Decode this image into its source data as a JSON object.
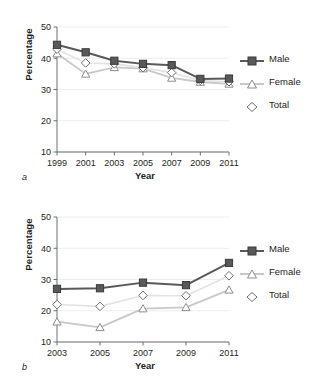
{
  "figure": {
    "panels": [
      {
        "key": "a",
        "label": "a",
        "axis": {
          "xlabel": "Year",
          "ylabel": "Percentage",
          "xticks": [
            "1999",
            "2001",
            "2003",
            "2005",
            "2007",
            "2009",
            "2011"
          ],
          "yticks": [
            "50",
            "40",
            "30",
            "20",
            "10"
          ]
        },
        "legend": [
          {
            "name": "Male",
            "marker": "square",
            "color": "#58595b"
          },
          {
            "name": "Female",
            "marker": "triangle",
            "color": "#c7c8ca"
          },
          {
            "name": "Total",
            "marker": "diamond",
            "color": "#c7c8ca"
          }
        ]
      },
      {
        "key": "b",
        "label": "b",
        "axis": {
          "xlabel": "Year",
          "ylabel": "Percentage",
          "xticks": [
            "2003",
            "2005",
            "2007",
            "2009",
            "2011"
          ],
          "yticks": [
            "50",
            "40",
            "30",
            "20",
            "10"
          ]
        },
        "legend": [
          {
            "name": "Male",
            "marker": "square",
            "color": "#58595b"
          },
          {
            "name": "Female",
            "marker": "triangle",
            "color": "#c7c8ca"
          },
          {
            "name": "Total",
            "marker": "diamond",
            "color": "#c7c8ca"
          }
        ]
      }
    ]
  },
  "chart_data": [
    {
      "type": "line",
      "panel": "a",
      "title": "",
      "xlabel": "Year",
      "ylabel": "Percentage",
      "categories": [
        1999,
        2001,
        2003,
        2005,
        2007,
        2009,
        2011
      ],
      "xlim": [
        1999,
        2011
      ],
      "ylim": [
        10,
        50
      ],
      "yticks": [
        10,
        20,
        30,
        40,
        50
      ],
      "grid": "horizontal",
      "legend_position": "right",
      "series": [
        {
          "name": "Male",
          "marker": "square",
          "color": "#58595b",
          "values": [
            44.3,
            41.9,
            39.2,
            38.2,
            37.8,
            33.4,
            33.5
          ]
        },
        {
          "name": "Female",
          "marker": "triangle",
          "color": "#c7c8ca",
          "values": [
            41.5,
            35.0,
            37.1,
            36.7,
            33.7,
            32.4,
            31.8
          ]
        },
        {
          "name": "Total",
          "marker": "diamond",
          "color": "#c7c8ca",
          "values": [
            42.9,
            38.5,
            38.2,
            37.0,
            35.4,
            32.9,
            32.5
          ]
        }
      ]
    },
    {
      "type": "line",
      "panel": "b",
      "title": "",
      "xlabel": "Year",
      "ylabel": "Percentage",
      "categories": [
        2003,
        2005,
        2007,
        2009,
        2011
      ],
      "xlim": [
        2003,
        2011
      ],
      "ylim": [
        10,
        50
      ],
      "yticks": [
        10,
        20,
        30,
        40,
        50
      ],
      "grid": "horizontal",
      "legend_position": "right",
      "series": [
        {
          "name": "Male",
          "marker": "square",
          "color": "#58595b",
          "values": [
            27.0,
            27.2,
            29.0,
            28.2,
            35.3
          ]
        },
        {
          "name": "Female",
          "marker": "triangle",
          "color": "#c7c8ca",
          "values": [
            16.5,
            14.7,
            20.7,
            21.1,
            26.7
          ]
        },
        {
          "name": "Total",
          "marker": "diamond",
          "color": "#c7c8ca",
          "values": [
            22.0,
            21.4,
            24.9,
            24.8,
            31.2
          ]
        }
      ]
    }
  ]
}
